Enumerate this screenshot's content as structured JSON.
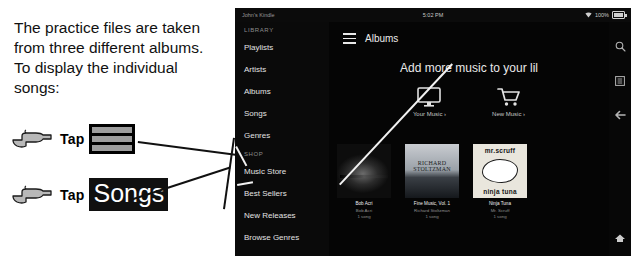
{
  "instructions": {
    "lines": [
      "The practice files are taken",
      "from three different albums.",
      "To display the individual",
      "songs:"
    ],
    "steps": [
      {
        "verb": "Tap",
        "target": "hamburger-menu-icon",
        "target_label": ""
      },
      {
        "verb": "Tap",
        "target": "songs-label",
        "target_label": "Songs"
      }
    ]
  },
  "device": {
    "statusbar": {
      "device_name": "John's Kindle",
      "time": "5:02 PM",
      "battery_percent": "100%",
      "wifi_icon": "wifi-icon",
      "battery_icon": "battery-icon"
    },
    "sidebar": {
      "sections": [
        {
          "header": "LIBRARY",
          "items": [
            "Playlists",
            "Artists",
            "Albums",
            "Songs",
            "Genres"
          ]
        },
        {
          "header": "SHOP",
          "items": [
            "Music Store",
            "Best Sellers",
            "New Releases",
            "Browse Genres"
          ]
        }
      ]
    },
    "content": {
      "menu_icon": "hamburger-menu-icon",
      "breadcrumb": "Albums",
      "promo": {
        "title": "Add more music to your lil",
        "actions": [
          {
            "icon": "monitor-icon",
            "label": "Your Music ›"
          },
          {
            "icon": "shopping-cart-icon",
            "label": "New Music ›"
          }
        ]
      },
      "albums": [
        {
          "title": "Bob Acri",
          "artist": "Bob Acri",
          "count": "1 song",
          "cover_class": "cv-bobacri",
          "cover_text_top": "",
          "cover_text_bottom": ""
        },
        {
          "title": "Fine Music, Vol. 1",
          "artist": "Richard Stoltzman",
          "count": "1 song",
          "cover_class": "cv-stoltz",
          "cover_text_top": "RICHARD STOLTZMAN",
          "cover_text_bottom": ""
        },
        {
          "title": "Ninja Tuna",
          "artist": "Mr. Scruff",
          "count": "1 song",
          "cover_class": "cv-scruff",
          "cover_text_top": "mr.scruff",
          "cover_text_bottom": "ninja tuna"
        }
      ]
    },
    "rail": {
      "icons": [
        "search-icon",
        "list-view-icon",
        "back-arrow-icon"
      ],
      "home_icon": "home-icon"
    }
  },
  "colors": {
    "page_bg": "#ffffff",
    "device_bg": "#050505",
    "sidebar_bg": "#0a0a0a",
    "text_light": "#e2e2e2",
    "text_dim": "#8d8d8d",
    "lead_line": "#111111",
    "callout_line": "#f2f2f2"
  }
}
